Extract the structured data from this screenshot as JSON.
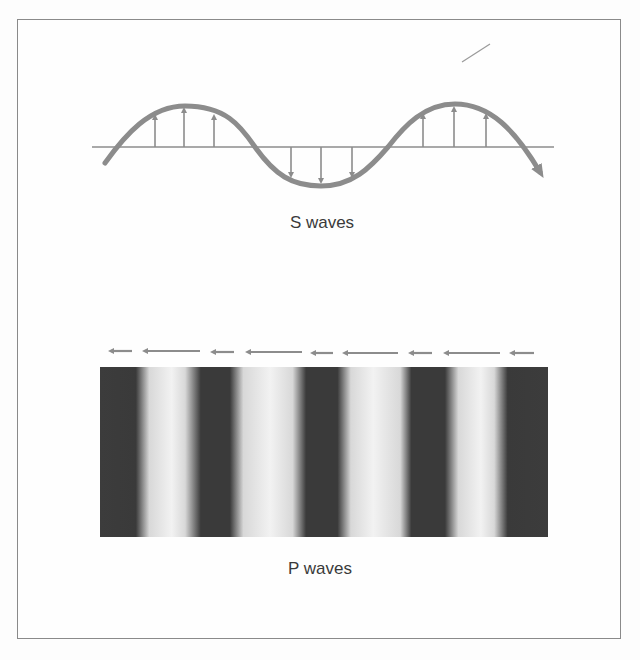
{
  "figure": {
    "top_cutoff_text": "",
    "s_wave": {
      "caption": "S waves",
      "description": "Transverse wave: particle motion perpendicular to propagation direction",
      "up_arrows_x": [
        155,
        184,
        214,
        423,
        454,
        486
      ],
      "down_arrows_x": [
        291,
        321,
        352
      ],
      "color": "#8c8c8c"
    },
    "p_wave": {
      "caption": "P waves",
      "description": "Longitudinal wave: compressions and rarefactions along propagation direction",
      "arrows": [
        {
          "x1": 106,
          "x2": 132
        },
        {
          "x1": 140,
          "x2": 200
        },
        {
          "x1": 208,
          "x2": 234
        },
        {
          "x1": 243,
          "x2": 302
        },
        {
          "x1": 308,
          "x2": 333
        },
        {
          "x1": 340,
          "x2": 398
        },
        {
          "x1": 406,
          "x2": 432
        },
        {
          "x1": 441,
          "x2": 500
        },
        {
          "x1": 507,
          "x2": 534
        }
      ],
      "compression_band_centers_x": [
        121,
        218,
        325,
        430,
        524
      ],
      "band_color": "#3a3a3a"
    }
  }
}
